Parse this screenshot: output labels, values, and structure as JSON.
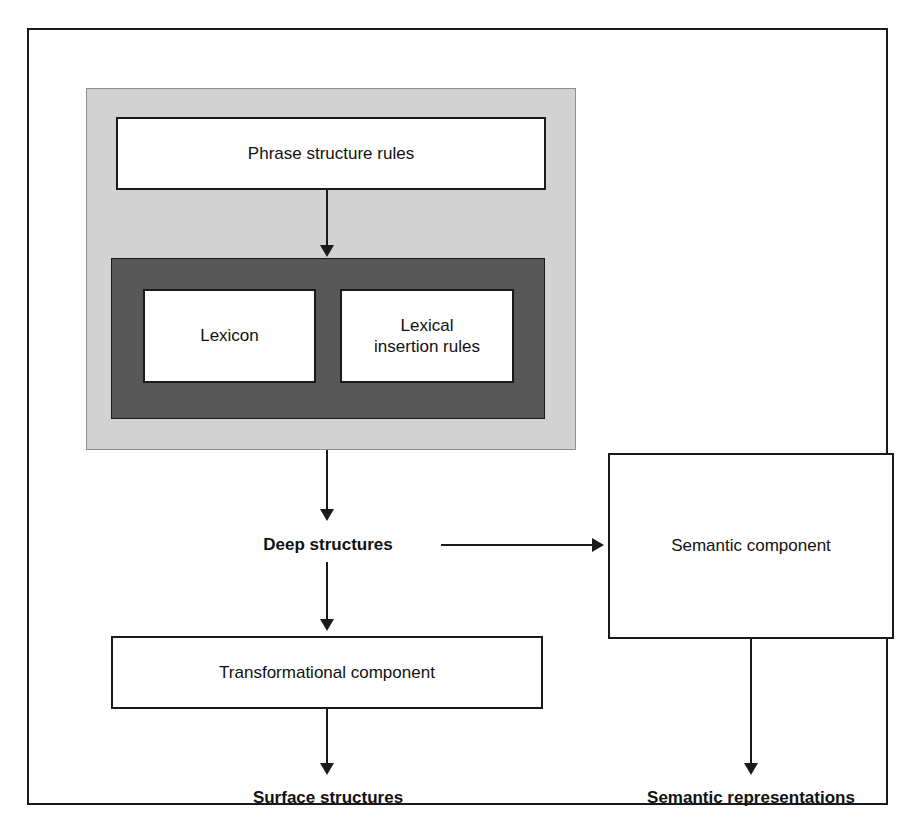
{
  "diagram": {
    "boxes": {
      "phrase_structure_rules": "Phrase structure rules",
      "lexicon": "Lexicon",
      "lexical_insertion_rules": "Lexical\ninsertion rules",
      "lexical_insertion_rules_line1": "Lexical",
      "lexical_insertion_rules_line2": "insertion rules",
      "transformational_component": "Transformational component",
      "semantic_component": "Semantic component"
    },
    "labels": {
      "deep_structures": "Deep structures",
      "surface_structures": "Surface structures",
      "semantic_representations": "Semantic representations"
    },
    "regions": {
      "outer_frame_color": "#1a1a1a",
      "light_gray_region_color": "#d2d2d2",
      "dark_gray_region_color": "#585858",
      "box_fill_color": "#ffffff",
      "text_color": "#111111"
    },
    "connectors": [
      {
        "from": "phrase_structure_rules",
        "to": "lexicon_region",
        "direction": "down"
      },
      {
        "from": "lexicon_region",
        "to": "deep_structures",
        "direction": "down"
      },
      {
        "from": "deep_structures",
        "to": "semantic_component",
        "direction": "right"
      },
      {
        "from": "deep_structures",
        "to": "transformational_component",
        "direction": "down"
      },
      {
        "from": "transformational_component",
        "to": "surface_structures",
        "direction": "down"
      },
      {
        "from": "semantic_component",
        "to": "semantic_representations",
        "direction": "down"
      }
    ]
  }
}
